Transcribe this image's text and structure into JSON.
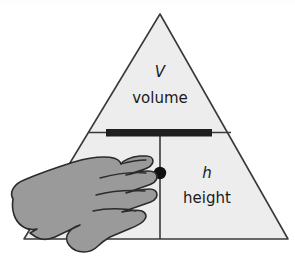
{
  "diagram": {
    "type": "formula-triangle",
    "shape": "triangle",
    "colors": {
      "background": "#ffffff",
      "triangle_fill": "#ededed",
      "triangle_stroke": "#3a3a3a",
      "divider_stroke": "#3a3a3a",
      "bar_fill": "#1f1f1f",
      "dot_fill": "#111111",
      "hand_fill": "#9a9a9a",
      "hand_stroke": "#2b2b2b",
      "text": "#1a1a1a"
    },
    "cells": {
      "top": {
        "symbol": "V",
        "word": "volume"
      },
      "bottom_left": {
        "symbol": "b",
        "word": "base",
        "occluded": true,
        "visible_fragment": "se"
      },
      "bottom_right": {
        "symbol": "h",
        "word": "height"
      }
    },
    "operators": {
      "fraction_bar": "division-bar",
      "multiply_dot": "multiplication-dot"
    },
    "overlay": {
      "name": "hand-silhouette",
      "description": "gray hand covering the base cell",
      "covers": "base"
    }
  }
}
